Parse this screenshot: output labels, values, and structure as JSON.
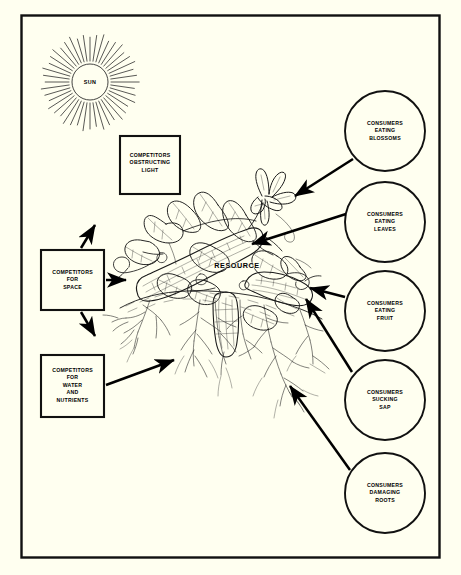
{
  "figure": {
    "type": "ecological-relationship-diagram",
    "subject": "RESOURCE",
    "background_color": "#fffff0",
    "ink_color": "#000000",
    "border": {
      "present": true,
      "color": "#000000"
    }
  },
  "sun": {
    "label": "SUN",
    "rays": 44,
    "center_x": 90,
    "center_y": 82,
    "radius": 18,
    "ray_inner": 21,
    "ray_outer": 47
  },
  "center": {
    "label": "RESOURCE",
    "illustration": "cucumber-squash-plant-with-fruit-leaves-blossoms-roots"
  },
  "boxes": [
    {
      "id": "competitors-obstructing-light",
      "lines": [
        "COMPETITORS",
        "OBSTRUCTING",
        "LIGHT"
      ],
      "x": 120,
      "y": 136,
      "w": 60,
      "h": 58
    },
    {
      "id": "competitors-for-space",
      "lines": [
        "COMPETITORS",
        "FOR",
        "SPACE"
      ],
      "x": 41,
      "y": 250,
      "w": 63,
      "h": 60
    },
    {
      "id": "competitors-for-water-and-nutrients",
      "lines": [
        "COMPETITORS",
        "FOR",
        "WATER",
        "AND",
        "NUTRIENTS"
      ],
      "x": 41,
      "y": 355,
      "w": 63,
      "h": 62
    }
  ],
  "circles": [
    {
      "id": "consumers-eating-blossoms",
      "lines": [
        "CONSUMERS",
        "EATING",
        "BLOSSOMS"
      ],
      "cx": 385,
      "cy": 131,
      "r": 40
    },
    {
      "id": "consumers-eating-leaves",
      "lines": [
        "CONSUMERS",
        "EATING",
        "LEAVES"
      ],
      "cx": 385,
      "cy": 222,
      "r": 40
    },
    {
      "id": "consumers-eating-fruit",
      "lines": [
        "CONSUMERS",
        "EATING",
        "FRUIT"
      ],
      "cx": 385,
      "cy": 311,
      "r": 40
    },
    {
      "id": "consumers-sucking-sap",
      "lines": [
        "CONSUMERS",
        "SUCKING",
        "SAP"
      ],
      "cx": 385,
      "cy": 400,
      "r": 40
    },
    {
      "id": "consumers-damaging-roots",
      "lines": [
        "CONSUMERS",
        "DAMAGING",
        "ROOTS"
      ],
      "cx": 385,
      "cy": 493,
      "r": 40
    }
  ],
  "arrows": [
    {
      "id": "arrow-blossoms-to-plant",
      "from": "consumers-eating-blossoms",
      "to": "plant-blossom"
    },
    {
      "id": "arrow-leaves-to-plant",
      "from": "consumers-eating-leaves",
      "to": "plant-leaf"
    },
    {
      "id": "arrow-fruit-to-plant",
      "from": "consumers-eating-fruit",
      "to": "plant-fruit"
    },
    {
      "id": "arrow-sap-to-plant",
      "from": "consumers-sucking-sap",
      "to": "plant-stem"
    },
    {
      "id": "arrow-roots-to-plant",
      "from": "consumers-damaging-roots",
      "to": "plant-roots"
    },
    {
      "id": "arrow-space-up",
      "from": "competitors-for-space",
      "to": "upper-left"
    },
    {
      "id": "arrow-space-right",
      "from": "competitors-for-space",
      "to": "plant-left"
    },
    {
      "id": "arrow-space-down",
      "from": "competitors-for-space",
      "to": "lower-right"
    },
    {
      "id": "arrow-water-to-plant",
      "from": "competitors-for-water-and-nutrients",
      "to": "plant-soil"
    }
  ]
}
